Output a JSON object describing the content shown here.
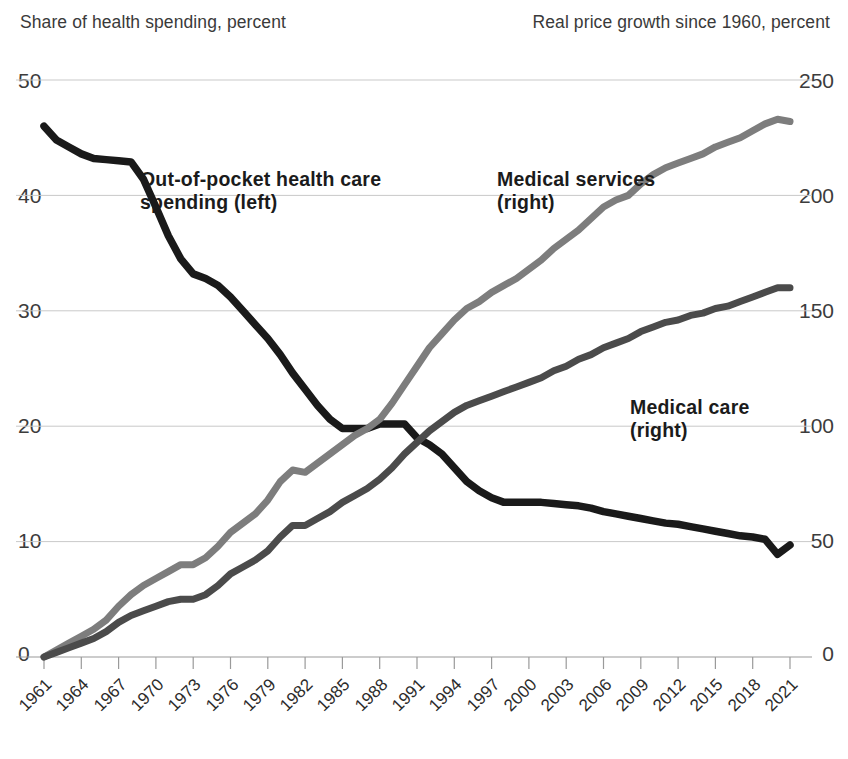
{
  "axes": {
    "left_title": "Share of health spending, percent",
    "right_title": "Real price growth since 1960, percent",
    "left_ticks": [
      "50",
      "40",
      "30",
      "20",
      "10",
      "0"
    ],
    "right_ticks": [
      "250",
      "200",
      "150",
      "100",
      "50",
      "0"
    ]
  },
  "labels": {
    "oop": "Out-of-pocket health care\nspending (left)",
    "services": "Medical services\n(right)",
    "care": "Medical care\n(right)"
  },
  "chart_data": {
    "type": "line",
    "title": "",
    "xlabel": "",
    "ylabel": "Share of health spending, percent",
    "y2label": "Real price growth since 1960, percent",
    "grid": true,
    "legend": "inline-annotations",
    "xlim": [
      1961,
      2021
    ],
    "ylim": [
      0,
      50
    ],
    "y2lim": [
      0,
      250
    ],
    "xticks": [
      "1961",
      "1964",
      "1967",
      "1970",
      "1973",
      "1976",
      "1979",
      "1982",
      "1985",
      "1988",
      "1991",
      "1994",
      "1997",
      "2000",
      "2003",
      "2006",
      "2009",
      "2012",
      "2015",
      "2018",
      "2021"
    ],
    "yticks": [
      0,
      10,
      20,
      30,
      40,
      50
    ],
    "y2ticks": [
      0,
      50,
      100,
      150,
      200,
      250
    ],
    "colors": {
      "out_of_pocket": "#1a1a1a",
      "medical_services": "#7d7d7d",
      "medical_care": "#4b4b4b"
    },
    "x": [
      1961,
      1962,
      1963,
      1964,
      1965,
      1966,
      1967,
      1968,
      1969,
      1970,
      1971,
      1972,
      1973,
      1974,
      1975,
      1976,
      1977,
      1978,
      1979,
      1980,
      1981,
      1982,
      1983,
      1984,
      1985,
      1986,
      1987,
      1988,
      1989,
      1990,
      1991,
      1992,
      1993,
      1994,
      1995,
      1996,
      1997,
      1998,
      1999,
      2000,
      2001,
      2002,
      2003,
      2004,
      2005,
      2006,
      2007,
      2008,
      2009,
      2010,
      2011,
      2012,
      2013,
      2014,
      2015,
      2016,
      2017,
      2018,
      2019,
      2020,
      2021
    ],
    "series": [
      {
        "name": "Out-of-pocket health care spending (left)",
        "axis": "left",
        "units": "percent",
        "values": [
          46.0,
          44.8,
          44.2,
          43.6,
          43.2,
          43.1,
          43.0,
          42.9,
          41.4,
          39.0,
          36.5,
          34.5,
          33.2,
          32.8,
          32.2,
          31.2,
          30.0,
          28.8,
          27.6,
          26.2,
          24.6,
          23.2,
          21.8,
          20.6,
          19.8,
          19.8,
          19.8,
          20.2,
          20.2,
          20.2,
          19.0,
          18.4,
          17.6,
          16.4,
          15.2,
          14.4,
          13.8,
          13.4,
          13.4,
          13.4,
          13.4,
          13.3,
          13.2,
          13.1,
          12.9,
          12.6,
          12.4,
          12.2,
          12.0,
          11.8,
          11.6,
          11.5,
          11.3,
          11.1,
          10.9,
          10.7,
          10.5,
          10.4,
          10.2,
          8.9,
          9.7
        ]
      },
      {
        "name": "Medical services (right)",
        "axis": "right",
        "units": "percent",
        "values": [
          0,
          3,
          6,
          9,
          12,
          16,
          22,
          27,
          31,
          34,
          37,
          40,
          40,
          43,
          48,
          54,
          58,
          62,
          68,
          76,
          81,
          80,
          84,
          88,
          92,
          96,
          99,
          103,
          110,
          118,
          126,
          134,
          140,
          146,
          151,
          154,
          158,
          161,
          164,
          168,
          172,
          177,
          181,
          185,
          190,
          195,
          198,
          200,
          205,
          209,
          212,
          214,
          216,
          218,
          221,
          223,
          225,
          228,
          231,
          233,
          232
        ]
      },
      {
        "name": "Medical care (right)",
        "axis": "right",
        "units": "percent",
        "values": [
          0,
          2,
          4,
          6,
          8,
          11,
          15,
          18,
          20,
          22,
          24,
          25,
          25,
          27,
          31,
          36,
          39,
          42,
          46,
          52,
          57,
          57,
          60,
          63,
          67,
          70,
          73,
          77,
          82,
          88,
          93,
          98,
          102,
          106,
          109,
          111,
          113,
          115,
          117,
          119,
          121,
          124,
          126,
          129,
          131,
          134,
          136,
          138,
          141,
          143,
          145,
          146,
          148,
          149,
          151,
          152,
          154,
          156,
          158,
          160,
          160
        ]
      }
    ]
  }
}
